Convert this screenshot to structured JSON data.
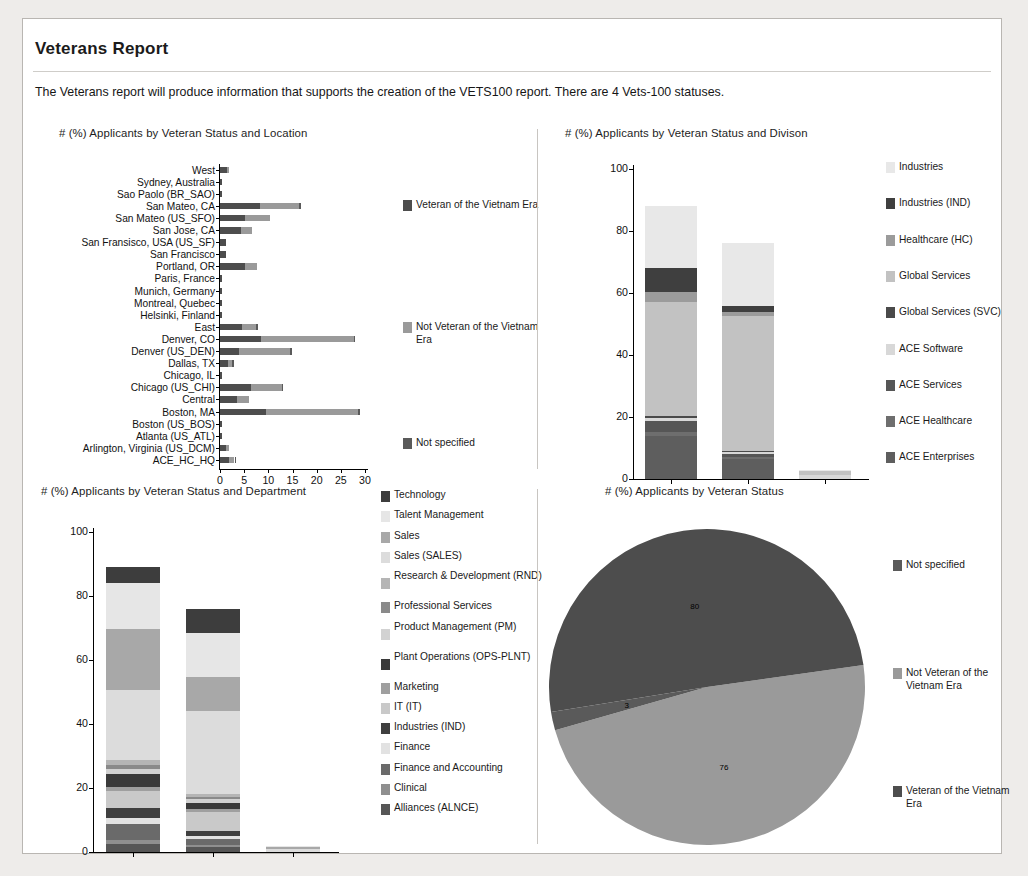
{
  "report": {
    "title": "Veterans Report",
    "description": "The Veterans report will produce information that supports the creation of the VETS100 report. There are 4 Vets-100 statuses."
  },
  "colors": {
    "veteran": "#4d4d4d",
    "not_veteran": "#9a9a9a",
    "not_specified": "#5a5a5a",
    "page_bg": "#eeecea",
    "card_bg": "#ffffff",
    "border": "#b9b6b2"
  },
  "chart_data": [
    {
      "id": "location-chart",
      "type": "bar",
      "orientation": "horizontal",
      "stacked": true,
      "title": "# (%) Applicants by Veteran Status and Location",
      "xlabel": "",
      "ylabel": "",
      "xlim": [
        0,
        30
      ],
      "xticks": [
        "0",
        "5",
        "10",
        "15",
        "20",
        "25",
        "30"
      ],
      "grid": false,
      "legend_position": "right",
      "categories": [
        "West",
        "Sydney, Australia",
        "Sao Paolo (BR_SAO)",
        "San Mateo, CA",
        "San Mateo (US_SFO)",
        "San Jose, CA",
        "San Fransisco, USA (US_SF)",
        "San Francisco",
        "Portland, OR",
        "Paris, France",
        "Munich, Germany",
        "Montreal, Quebec",
        "Helsinki, Finland",
        "East",
        "Denver, CO",
        "Denver (US_DEN)",
        "Dallas, TX",
        "Chicago, IL",
        "Chicago (US_CHI)",
        "Central",
        "Boston, MA",
        "Boston (US_BOS)",
        "Atlanta (US_ATL)",
        "Arlington, Virginia (US_DCM)",
        "ACE_HC_HQ"
      ],
      "series": [
        {
          "name": "Veteran of the Vietnam Era",
          "color": "#4d4d4d",
          "values": [
            1.4,
            0.5,
            0.5,
            8.2,
            5.2,
            4.4,
            1.3,
            1.3,
            5.1,
            0.4,
            0.4,
            0.4,
            0.4,
            4.5,
            8.4,
            4.0,
            1.6,
            0.5,
            6.5,
            3.5,
            9.5,
            0.5,
            0.5,
            1.2,
            1.8
          ]
        },
        {
          "name": "Not Veteran of the Vietnam Era",
          "color": "#9a9a9a",
          "values": [
            0.5,
            0.0,
            0.0,
            8.2,
            5.2,
            2.3,
            0.0,
            0.0,
            2.6,
            0.0,
            0.0,
            0.0,
            0.0,
            3.0,
            19.3,
            10.5,
            0.9,
            0.0,
            6.3,
            2.5,
            19.1,
            0.0,
            0.0,
            0.7,
            1.2
          ]
        },
        {
          "name": "Not specified",
          "color": "#5a5a5a",
          "values": [
            0.0,
            0.0,
            0.0,
            0.4,
            0.0,
            0.0,
            0.0,
            0.0,
            0.0,
            0.0,
            0.0,
            0.0,
            0.0,
            0.3,
            0.3,
            0.3,
            0.3,
            0.0,
            0.2,
            0.0,
            0.3,
            0.0,
            0.0,
            0.0,
            0.3
          ]
        }
      ],
      "legend": [
        {
          "label": "Veteran of the Vietnam Era",
          "color": "#4d4d4d"
        },
        {
          "label": "Not Veteran of the Vietnam Era",
          "color": "#9a9a9a"
        },
        {
          "label": "Not specified",
          "color": "#5a5a5a"
        }
      ]
    },
    {
      "id": "division-chart",
      "type": "bar",
      "orientation": "vertical",
      "stacked": true,
      "title": "# (%) Applicants by Veteran Status and Divison",
      "ylim": [
        0,
        100
      ],
      "yticks": [
        "0",
        "20",
        "40",
        "60",
        "80",
        "100"
      ],
      "grid": false,
      "legend_position": "right",
      "categories": [
        "Veteran of the Vietnam Era",
        "Not Veteran of the Vietnam Era",
        "Not specified"
      ],
      "totals": [
        88,
        76,
        3
      ],
      "series": [
        {
          "name": "ACE Enterprises",
          "color": "#5e5e5e",
          "values": [
            14.0,
            6.5,
            0.0
          ]
        },
        {
          "name": "ACE Healthcare",
          "color": "#6e6e6e",
          "values": [
            1.2,
            0.6,
            0.0
          ]
        },
        {
          "name": "ACE Services",
          "color": "#565656",
          "values": [
            3.6,
            1.0,
            0.0
          ]
        },
        {
          "name": "ACE Software",
          "color": "#d8d8d8",
          "values": [
            0.9,
            0.7,
            1.2
          ]
        },
        {
          "name": "Global Services (SVC)",
          "color": "#4a4a4a",
          "values": [
            0.5,
            0.3,
            0.0
          ]
        },
        {
          "name": "Global Services",
          "color": "#c2c2c2",
          "values": [
            37.0,
            43.5,
            1.5
          ]
        },
        {
          "name": "Healthcare (HC)",
          "color": "#9b9b9b",
          "values": [
            3.0,
            1.3,
            0.0
          ]
        },
        {
          "name": "Industries (IND)",
          "color": "#3f3f3f",
          "values": [
            8.0,
            2.0,
            0.0
          ]
        },
        {
          "name": "Industries",
          "color": "#e8e8e8",
          "values": [
            19.8,
            20.1,
            0.3
          ]
        }
      ],
      "legend": [
        {
          "label": "Industries",
          "color": "#e8e8e8"
        },
        {
          "label": "Industries (IND)",
          "color": "#3f3f3f"
        },
        {
          "label": "Healthcare (HC)",
          "color": "#9b9b9b"
        },
        {
          "label": "Global Services",
          "color": "#c2c2c2"
        },
        {
          "label": "Global Services (SVC)",
          "color": "#4a4a4a"
        },
        {
          "label": "ACE Software",
          "color": "#d8d8d8"
        },
        {
          "label": "ACE Services",
          "color": "#565656"
        },
        {
          "label": "ACE Healthcare",
          "color": "#6e6e6e"
        },
        {
          "label": "ACE Enterprises",
          "color": "#5e5e5e"
        }
      ]
    },
    {
      "id": "department-chart",
      "type": "bar",
      "orientation": "vertical",
      "stacked": true,
      "title": "# (%) Applicants by Veteran Status and Department",
      "ylim": [
        0,
        100
      ],
      "yticks": [
        "0",
        "20",
        "40",
        "60",
        "80",
        "100"
      ],
      "grid": false,
      "legend_position": "right",
      "categories": [
        "Veteran of the Vietnam Era",
        "Not Veteran of the Vietnam Era",
        "Not specified"
      ],
      "totals": [
        89,
        76,
        2
      ],
      "series": [
        {
          "name": "Alliances (ALNCE)",
          "color": "#565656",
          "values": [
            2.6,
            1.6,
            0.0
          ]
        },
        {
          "name": "Clinical",
          "color": "#8f8f8f",
          "values": [
            1.0,
            0.5,
            0.0
          ]
        },
        {
          "name": "Finance and Accounting",
          "color": "#6a6a6a",
          "values": [
            5.0,
            2.0,
            0.0
          ]
        },
        {
          "name": "Finance",
          "color": "#e2e2e2",
          "values": [
            2.0,
            1.0,
            0.0
          ]
        },
        {
          "name": "Industries (IND)",
          "color": "#3f3f3f",
          "values": [
            3.2,
            1.4,
            0.0
          ]
        },
        {
          "name": "IT (IT)",
          "color": "#c9c9c9",
          "values": [
            5.2,
            6.0,
            0.0
          ]
        },
        {
          "name": "Marketing",
          "color": "#9f9f9f",
          "values": [
            1.2,
            0.8,
            0.0
          ]
        },
        {
          "name": "Plant Operations (OPS-PLNT)",
          "color": "#3a3a3a",
          "values": [
            4.2,
            2.0,
            0.0
          ]
        },
        {
          "name": "Product Management (PM)",
          "color": "#d2d2d2",
          "values": [
            1.5,
            1.2,
            0.0
          ]
        },
        {
          "name": "Professional Services",
          "color": "#8a8a8a",
          "values": [
            1.2,
            0.6,
            0.0
          ]
        },
        {
          "name": "Research & Development (RND)",
          "color": "#b5b5b5",
          "values": [
            1.5,
            1.1,
            0.0
          ]
        },
        {
          "name": "Sales (SALES)",
          "color": "#dcdcdc",
          "values": [
            22.0,
            26.0,
            1.0
          ]
        },
        {
          "name": "Sales",
          "color": "#a8a8a8",
          "values": [
            19.0,
            10.5,
            0.6
          ]
        },
        {
          "name": "Talent Management",
          "color": "#e6e6e6",
          "values": [
            14.4,
            13.8,
            0.4
          ]
        },
        {
          "name": "Technology",
          "color": "#3d3d3d",
          "values": [
            5.0,
            7.5,
            0.0
          ]
        }
      ],
      "legend": [
        {
          "label": "Technology",
          "color": "#3d3d3d"
        },
        {
          "label": "Talent Management",
          "color": "#e6e6e6"
        },
        {
          "label": "Sales",
          "color": "#a8a8a8"
        },
        {
          "label": "Sales (SALES)",
          "color": "#dcdcdc"
        },
        {
          "label": "Research & Development (RND)",
          "color": "#b5b5b5"
        },
        {
          "label": "Professional Services",
          "color": "#8a8a8a"
        },
        {
          "label": "Product Management (PM)",
          "color": "#d2d2d2"
        },
        {
          "label": "Plant Operations (OPS-PLNT)",
          "color": "#3a3a3a"
        },
        {
          "label": "Marketing",
          "color": "#9f9f9f"
        },
        {
          "label": "IT (IT)",
          "color": "#c9c9c9"
        },
        {
          "label": "Industries (IND)",
          "color": "#3f3f3f"
        },
        {
          "label": "Finance",
          "color": "#e2e2e2"
        },
        {
          "label": "Finance and Accounting",
          "color": "#6a6a6a"
        },
        {
          "label": "Clinical",
          "color": "#8f8f8f"
        },
        {
          "label": "Alliances (ALNCE)",
          "color": "#565656"
        }
      ]
    },
    {
      "id": "status-pie",
      "type": "pie",
      "title": "# (%) Applicants by Veteran Status",
      "legend_position": "right",
      "labels": [
        "Not specified",
        "Not Veteran of the Vietnam Era",
        "Veteran of the Vietnam Era"
      ],
      "values": [
        3,
        76,
        80
      ],
      "data_labels": [
        "3",
        "76",
        "80"
      ],
      "slices": [
        {
          "label": "Not Veteran of the Vietnam Era",
          "value": 76,
          "data_label": "76",
          "color": "#9a9a9a"
        },
        {
          "label": "Not specified",
          "value": 3,
          "data_label": "3",
          "color": "#5a5a5a"
        },
        {
          "label": "Veteran of the Vietnam Era",
          "value": 80,
          "data_label": "80",
          "color": "#4d4d4d"
        }
      ],
      "legend": [
        {
          "label": "Not specified",
          "color": "#5a5a5a"
        },
        {
          "label": "Not Veteran of the Vietnam Era",
          "color": "#9a9a9a"
        },
        {
          "label": "Veteran of the Vietnam Era",
          "color": "#4d4d4d"
        }
      ]
    }
  ]
}
